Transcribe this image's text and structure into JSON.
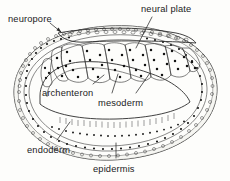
{
  "figure": {
    "background_color": "#fdfdfb",
    "ink_color": "#1b1b1b",
    "style": "hand-drawn line illustration, stippled cell nuclei"
  },
  "labels": {
    "neuropore": "neuropore",
    "neural_plate": "neural plate",
    "archenteron": "archenteron",
    "mesoderm": "mesoderm",
    "endoderm": "endoderm",
    "epidermis": "epidermis"
  },
  "structures": [
    {
      "name": "neuropore",
      "label": "neuropore",
      "pointer": "arrow",
      "position": "top-left"
    },
    {
      "name": "neural-plate",
      "label": "neural plate",
      "pointer": "line",
      "position": "top-right"
    },
    {
      "name": "archenteron",
      "label": "archenteron",
      "pointer": "line",
      "position": "center-left"
    },
    {
      "name": "mesoderm",
      "label": "mesoderm",
      "pointer": "double-line",
      "position": "center"
    },
    {
      "name": "endoderm",
      "label": "endoderm",
      "pointer": "line",
      "position": "bottom-left"
    },
    {
      "name": "epidermis",
      "label": "epidermis",
      "pointer": "line",
      "position": "bottom-center"
    }
  ]
}
